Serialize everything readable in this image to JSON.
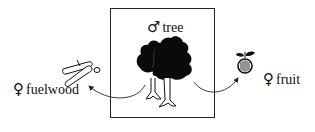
{
  "diagram": {
    "center": {
      "symbol": "♂",
      "label": "tree",
      "icon": "tree-icon"
    },
    "left": {
      "symbol": "♀",
      "label": "fuelwood",
      "icon": "firewood-icon"
    },
    "right": {
      "symbol": "♀",
      "label": "fruit",
      "icon": "fruit-icon"
    },
    "arrows": [
      {
        "from": "tree",
        "to": "fuelwood"
      },
      {
        "from": "tree",
        "to": "fruit"
      }
    ],
    "colors": {
      "ink": "#111111",
      "background": "#ffffff"
    }
  }
}
